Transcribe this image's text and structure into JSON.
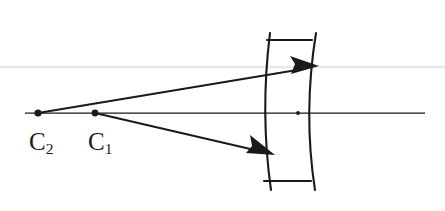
{
  "figure": {
    "background_color": "#ffffff",
    "ink_color": "#1a1a1a",
    "artifact_color": "#e9e9e9",
    "width": 445,
    "height": 211
  },
  "labels": {
    "c2": {
      "base": "C",
      "subscript": "2",
      "text": "C2"
    },
    "c1": {
      "base": "C",
      "subscript": "1",
      "text": "C1"
    }
  },
  "points": {
    "c2_center": {
      "x": 38,
      "y": 113,
      "name": "C2"
    },
    "c1_center": {
      "x": 95,
      "y": 113,
      "name": "C1"
    },
    "lens_vertex": {
      "x": 298,
      "y": 113,
      "name": "vertex"
    }
  },
  "optical_axis": {
    "x1": 25,
    "y1": 113,
    "x2": 425,
    "y2": 113
  },
  "scan_artifact_line": {
    "x1": 0,
    "y1": 67,
    "x2": 445,
    "y2": 67
  },
  "lens": {
    "type": "meniscus",
    "front_arc": {
      "top_x": 270,
      "top_y": 33,
      "mid_x": 264,
      "mid_y": 113,
      "bottom_x": 271,
      "bottom_y": 190
    },
    "back_arc": {
      "top_x": 316,
      "top_y": 33,
      "mid_x": 307,
      "mid_y": 113,
      "bottom_x": 315,
      "bottom_y": 190
    },
    "top_edge": {
      "x1": 267,
      "y1": 40,
      "x2": 312,
      "y2": 40
    },
    "bottom_edge": {
      "x1": 264,
      "y1": 181,
      "x2": 311,
      "y2": 181
    }
  },
  "rays": [
    {
      "name": "upper-ray",
      "from_point": "C2",
      "x1": 38,
      "y1": 113,
      "x2": 317,
      "y2": 67,
      "arrowhead": "at-end"
    },
    {
      "name": "lower-ray",
      "from_point": "C1",
      "x1": 95,
      "y1": 113,
      "x2": 273,
      "y2": 154,
      "arrowhead": "at-end"
    }
  ]
}
